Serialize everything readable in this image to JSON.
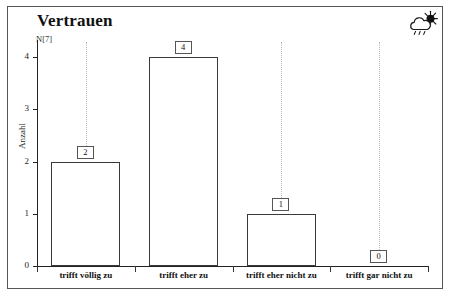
{
  "chart_data": {
    "type": "bar",
    "title": "Vertrauen",
    "n_label": "N[7]",
    "ylabel": "Anzahl",
    "xlabel": "",
    "categories": [
      "trifft völlig zu",
      "trifft eher zu",
      "trifft eher nicht zu",
      "trifft gar nicht zu"
    ],
    "values": [
      2,
      4,
      1,
      0
    ],
    "value_labels": [
      "2",
      "4",
      "1",
      "0"
    ],
    "ylim": [
      0,
      4
    ],
    "y_ticks": [
      "0",
      "1",
      "2",
      "3",
      "4"
    ],
    "grid": "dotted-vertical",
    "legend": "none",
    "bar_fill_color": "#ffffff",
    "bar_border_color": "#3a3a3a",
    "axis_color": "#222222",
    "grid_color": "#b9b9b9",
    "frame_color": "#555555"
  },
  "icons": {
    "weather": "sun-behind-cloud-icon"
  },
  "footer": {
    "clipped_text": ""
  }
}
